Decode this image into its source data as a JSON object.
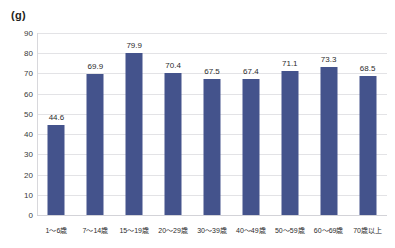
{
  "chart_data": {
    "type": "bar",
    "title": "",
    "subtitle": "",
    "xlabel": "",
    "ylabel": "(g)",
    "unit_label": "(g)",
    "categories": [
      "1～6歳",
      "7～14歳",
      "15～19歳",
      "20～29歳",
      "30～39歳",
      "40～49歳",
      "50～59歳",
      "60～69歳",
      "70歳以上"
    ],
    "values": [
      44.6,
      69.9,
      79.9,
      70.4,
      67.5,
      67.4,
      71.1,
      73.3,
      68.5
    ],
    "value_labels": [
      "44.6",
      "69.9",
      "79.9",
      "70.4",
      "67.5",
      "67.4",
      "71.1",
      "73.3",
      "68.5"
    ],
    "ylim": [
      0,
      90
    ],
    "ytick_values": [
      0,
      10,
      20,
      30,
      40,
      50,
      60,
      70,
      80,
      90
    ],
    "ytick_labels": [
      "0",
      "10",
      "20",
      "30",
      "40",
      "50",
      "60",
      "70",
      "80",
      "90"
    ],
    "grid": true,
    "grid_axis": "y",
    "legend": false,
    "legend_position": "none",
    "series": [
      {
        "name": "",
        "values": [
          44.6,
          69.9,
          79.9,
          70.4,
          67.5,
          67.4,
          71.1,
          73.3,
          68.5
        ]
      }
    ]
  },
  "colors": {
    "bar": "#44538c",
    "gridline": "#e3e3e6",
    "axis": "#d8d8dc",
    "text": "#2b2b2b",
    "tick_text": "#3a3a3a",
    "background": "#ffffff"
  }
}
